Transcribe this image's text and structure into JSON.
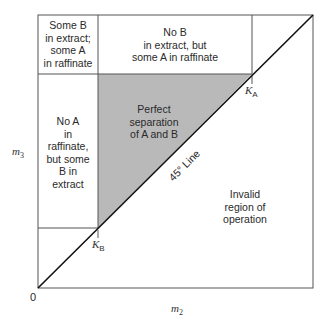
{
  "diagram": {
    "type": "separation-region-diagram",
    "axes": {
      "x_label": "m",
      "x_sub": "2",
      "y_label": "m",
      "y_sub": "3",
      "origin_label": "0"
    },
    "markers": {
      "ka_label": "K",
      "ka_sub": "A",
      "kb_label": "K",
      "kb_sub": "B"
    },
    "diagonal_label": "45° Line",
    "regions": [
      {
        "id": "top-left",
        "lines": [
          "Some B",
          "in extract;",
          "some A",
          "in raffinate"
        ]
      },
      {
        "id": "top-middle",
        "lines": [
          "No B",
          "in extract, but",
          "some A in raffinate"
        ]
      },
      {
        "id": "left",
        "lines": [
          "No A",
          "in",
          "raffinate,",
          "but some",
          "B in",
          "extract"
        ]
      },
      {
        "id": "triangle",
        "lines": [
          "Perfect",
          "separation",
          "of A and B"
        ]
      },
      {
        "id": "invalid",
        "lines": [
          "Invalid",
          "region of",
          "operation"
        ]
      }
    ],
    "colors": {
      "triangle_fill": "#b9b9b9",
      "lines": "#444444",
      "diagonal": "#111111"
    }
  }
}
